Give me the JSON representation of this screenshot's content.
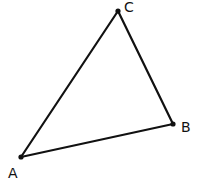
{
  "diagram": {
    "type": "triangle",
    "stroke_color": "#111111",
    "background": "#ffffff",
    "vertices": [
      {
        "id": "A",
        "label": "A",
        "x": 21,
        "y": 157,
        "label_x": 8,
        "label_y": 178
      },
      {
        "id": "B",
        "label": "B",
        "x": 173,
        "y": 124,
        "label_x": 181,
        "label_y": 132
      },
      {
        "id": "C",
        "label": "C",
        "x": 118,
        "y": 11,
        "label_x": 124,
        "label_y": 12
      }
    ],
    "edges": [
      {
        "from": "A",
        "to": "B"
      },
      {
        "from": "B",
        "to": "C"
      },
      {
        "from": "C",
        "to": "A"
      }
    ]
  }
}
